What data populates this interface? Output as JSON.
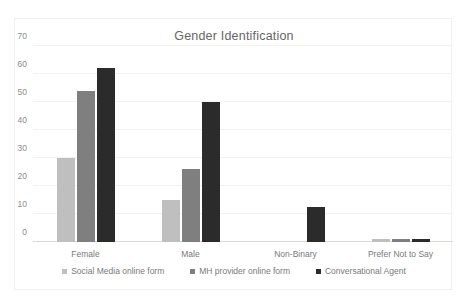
{
  "chart_data": {
    "type": "bar",
    "title": "Gender Identification",
    "xlabel": "",
    "ylabel": "",
    "ylim": [
      0,
      70
    ],
    "yticks": [
      0,
      10,
      20,
      30,
      40,
      50,
      60,
      70
    ],
    "grid": true,
    "legend_position": "bottom",
    "categories": [
      "Female",
      "Male",
      "Non-Binary",
      "Prefer Not to Say"
    ],
    "series": [
      {
        "name": "Social Media online form",
        "color": "#bfbfbf",
        "values": [
          30,
          15,
          0,
          1
        ]
      },
      {
        "name": "MH provider online form",
        "color": "#7f7f7f",
        "values": [
          54,
          26,
          0,
          1
        ]
      },
      {
        "name": "Conversational Agent",
        "color": "#2b2b2b",
        "values": [
          62,
          50,
          12.5,
          1
        ]
      }
    ]
  }
}
